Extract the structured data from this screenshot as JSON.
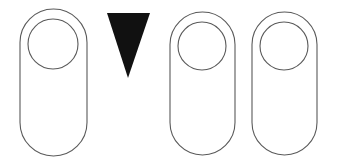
{
  "figure": {
    "background_color": "#ffffff",
    "outline_color": "#5a5a5a",
    "solid_color": "#111111",
    "canvas": {
      "width": 339,
      "height": 166
    },
    "shape_count": 4,
    "shapes": [
      {
        "index": 1,
        "name": "pill-with-circle-1",
        "type": "stadium-outline-with-circle",
        "fill": "none",
        "stroke": "#5a5a5a",
        "stroke_width": 1.1,
        "body": {
          "x": 20,
          "y": 9,
          "width": 67,
          "height": 147,
          "corner_radius": 33.5
        },
        "circle": {
          "cx": 53,
          "cy": 44,
          "r": 25
        }
      },
      {
        "index": 2,
        "name": "down-triangle",
        "type": "triangle-solid-down",
        "fill": "#111111",
        "stroke": "none",
        "points": "107,13 150,13 128,78"
      },
      {
        "index": 3,
        "name": "pill-with-circle-2",
        "type": "stadium-outline-with-circle",
        "fill": "none",
        "stroke": "#5a5a5a",
        "stroke_width": 1.1,
        "body": {
          "x": 170,
          "y": 12,
          "width": 65,
          "height": 143,
          "corner_radius": 32.5
        },
        "circle": {
          "cx": 202,
          "cy": 46,
          "r": 24
        }
      },
      {
        "index": 4,
        "name": "pill-with-circle-3",
        "type": "stadium-outline-with-circle",
        "fill": "none",
        "stroke": "#5a5a5a",
        "stroke_width": 1.1,
        "body": {
          "x": 252,
          "y": 12,
          "width": 65,
          "height": 143,
          "corner_radius": 32.5
        },
        "circle": {
          "cx": 284,
          "cy": 46,
          "r": 24
        }
      }
    ]
  }
}
